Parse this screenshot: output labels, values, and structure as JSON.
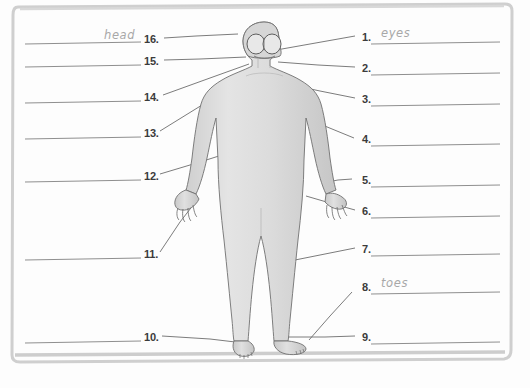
{
  "worksheet": {
    "title": "Human body parts labelling worksheet",
    "figure_name": "human-body-outline",
    "frame_color": "#c9c9c9",
    "line_color": "#8f8f8f",
    "body_fill": "#d9d9d9",
    "body_stroke": "#6f6f6f",
    "answer_text_color": "#a8a8a8"
  },
  "left_column": {
    "items": [
      {
        "number": "16.",
        "answer": "head",
        "y": 39,
        "line_y": 43
      },
      {
        "number": "15.",
        "answer": "",
        "y": 61,
        "line_y": 66
      },
      {
        "number": "14.",
        "answer": "",
        "y": 97,
        "line_y": 102
      },
      {
        "number": "13.",
        "answer": "",
        "y": 133,
        "line_y": 138
      },
      {
        "number": "12.",
        "answer": "",
        "y": 176,
        "line_y": 181
      },
      {
        "number": "11.",
        "answer": "",
        "y": 254,
        "line_y": 259
      },
      {
        "number": "10.",
        "answer": "",
        "y": 337,
        "line_y": 342
      }
    ]
  },
  "right_column": {
    "items": [
      {
        "number": "1.",
        "answer": "eyes",
        "y": 37,
        "line_y": 43
      },
      {
        "number": "2.",
        "answer": "",
        "y": 68,
        "line_y": 74
      },
      {
        "number": "3.",
        "answer": "",
        "y": 99,
        "line_y": 105
      },
      {
        "number": "4.",
        "answer": "",
        "y": 139,
        "line_y": 145
      },
      {
        "number": "5.",
        "answer": "",
        "y": 180,
        "line_y": 186
      },
      {
        "number": "6.",
        "answer": "",
        "y": 211,
        "line_y": 217
      },
      {
        "number": "7.",
        "answer": "",
        "y": 249,
        "line_y": 255
      },
      {
        "number": "8.",
        "answer": "toes",
        "y": 287,
        "line_y": 293
      },
      {
        "number": "9.",
        "answer": "",
        "y": 337,
        "line_y": 343
      }
    ]
  }
}
